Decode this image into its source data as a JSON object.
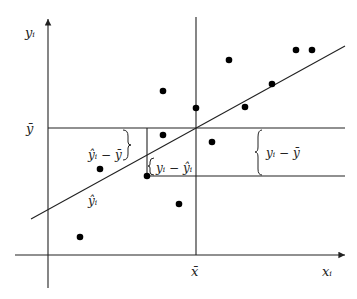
{
  "diagram": {
    "labels": {
      "y_axis": "yᵢ",
      "x_axis": "xᵢ",
      "y_mean": "ȳ",
      "x_mean": "x̄",
      "explained_dev": "ŷᵢ − ȳ",
      "residual": "yᵢ − ŷᵢ",
      "total_dev": "yᵢ − ȳ",
      "fitted": "ŷᵢ"
    },
    "points": [
      {
        "x": 163,
        "y": 91
      },
      {
        "x": 196,
        "y": 108
      },
      {
        "x": 229,
        "y": 60
      },
      {
        "x": 296,
        "y": 50
      },
      {
        "x": 312,
        "y": 50
      },
      {
        "x": 272,
        "y": 84
      },
      {
        "x": 245,
        "y": 107
      },
      {
        "x": 163,
        "y": 135
      },
      {
        "x": 212,
        "y": 142
      },
      {
        "x": 147,
        "y": 176
      },
      {
        "x": 100,
        "y": 169
      },
      {
        "x": 179,
        "y": 204
      },
      {
        "x": 80,
        "y": 237
      }
    ],
    "regression_line": {
      "x1": 31,
      "y1": 219,
      "x2": 345,
      "y2": 46
    },
    "colors": {
      "line": "#222222",
      "point": "#000000",
      "background": "#ffffff"
    }
  }
}
